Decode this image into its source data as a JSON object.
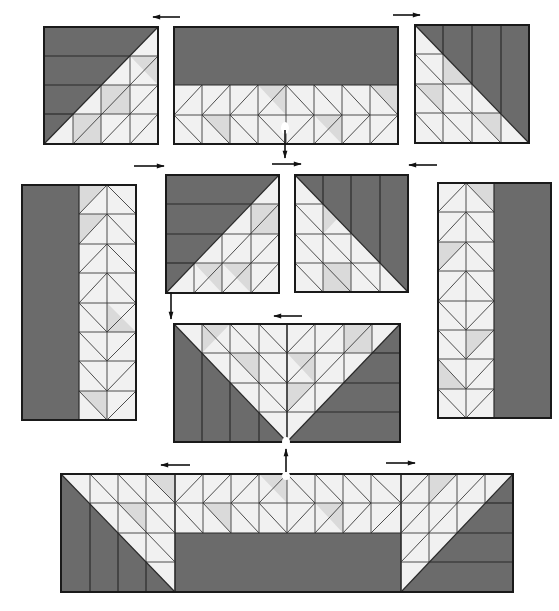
{
  "colors": {
    "dark_fabric": "#6b6b6b",
    "light_fabric": "#f1f1f1",
    "medium_fabric": "#dadada",
    "outline": "#1a1a1a",
    "background": "#ffffff"
  },
  "blocks": [
    {
      "id": "row1-left",
      "kind": "corner-diagonal",
      "x": 44,
      "y": 27,
      "w": 114,
      "h": 117,
      "orientation": "dark-top-left"
    },
    {
      "id": "row1-center",
      "kind": "bar-hst-strip",
      "x": 174,
      "y": 27,
      "w": 224,
      "h": 117,
      "orientation": "dark-top"
    },
    {
      "id": "row1-right",
      "kind": "corner-diagonal",
      "x": 415,
      "y": 25,
      "w": 114,
      "h": 118,
      "orientation": "dark-top-right"
    },
    {
      "id": "row2-left-tall",
      "kind": "side-column",
      "x": 22,
      "y": 185,
      "w": 114,
      "h": 235,
      "orientation": "dark-left"
    },
    {
      "id": "row2-center-left",
      "kind": "corner-diagonal",
      "x": 166,
      "y": 175,
      "w": 113,
      "h": 118,
      "orientation": "dark-top-left"
    },
    {
      "id": "row2-center-right",
      "kind": "corner-diagonal",
      "x": 295,
      "y": 175,
      "w": 113,
      "h": 117,
      "orientation": "dark-top-right"
    },
    {
      "id": "row2-right-tall",
      "kind": "side-column",
      "x": 438,
      "y": 183,
      "w": 113,
      "h": 235,
      "orientation": "dark-right"
    },
    {
      "id": "row3-center",
      "kind": "center-v",
      "x": 174,
      "y": 324,
      "w": 226,
      "h": 118,
      "orientation": "light-v"
    },
    {
      "id": "row4-bottom",
      "kind": "bottom-bar",
      "x": 61,
      "y": 474,
      "w": 452,
      "h": 118,
      "orientation": "dark-bottom"
    }
  ],
  "arrows": [
    {
      "id": "arrow-row1-left",
      "direction": "left",
      "x1": 180,
      "y1": 17,
      "x2": 152,
      "y2": 17
    },
    {
      "id": "arrow-row1-right",
      "direction": "right",
      "x1": 393,
      "y1": 15,
      "x2": 421,
      "y2": 15
    },
    {
      "id": "arrow-row2-left",
      "direction": "right",
      "x1": 134,
      "y1": 166,
      "x2": 165,
      "y2": 166
    },
    {
      "id": "arrow-row2-center",
      "direction": "right",
      "x1": 272,
      "y1": 164,
      "x2": 302,
      "y2": 164
    },
    {
      "id": "arrow-row2-right",
      "direction": "left",
      "x1": 437,
      "y1": 165,
      "x2": 408,
      "y2": 165
    },
    {
      "id": "arrow-row3",
      "direction": "left",
      "x1": 302,
      "y1": 316,
      "x2": 273,
      "y2": 316
    },
    {
      "id": "arrow-row4-left",
      "direction": "left",
      "x1": 190,
      "y1": 465,
      "x2": 160,
      "y2": 465
    },
    {
      "id": "arrow-row4-right",
      "direction": "right",
      "x1": 386,
      "y1": 463,
      "x2": 416,
      "y2": 463
    },
    {
      "id": "arrow-seam-top",
      "direction": "down",
      "x1": 285,
      "y1": 125,
      "x2": 285,
      "y2": 160
    },
    {
      "id": "arrow-seam-left",
      "direction": "down",
      "x1": 171,
      "y1": 290,
      "x2": 171,
      "y2": 320
    },
    {
      "id": "arrow-seam-bottom",
      "direction": "up",
      "x1": 286,
      "y1": 474,
      "x2": 286,
      "y2": 448
    }
  ]
}
